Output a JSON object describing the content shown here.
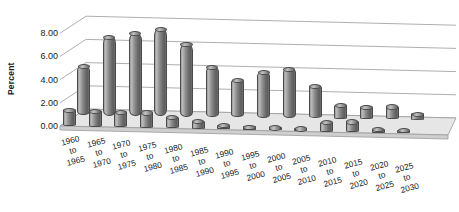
{
  "chart_data": {
    "type": "bar",
    "title": "",
    "subtitle": "",
    "xlabel": "",
    "ylabel": "Percent",
    "ylim": [
      0,
      8
    ],
    "yticks": [
      "0.00",
      "2.00",
      "4.00",
      "6.00",
      "8.00"
    ],
    "ytick_values": [
      0,
      2,
      4,
      6,
      8
    ],
    "grid": true,
    "legend": "none",
    "projection": "3d-cylinder",
    "categories": [
      "1960 to 1965",
      "1965 to 1970",
      "1970 to 1975",
      "1975 to 1980",
      "1980 to 1985",
      "1985 to 1990",
      "1990 to 1995",
      "1995 to 2000",
      "2000 to 2005",
      "2005 to 2010",
      "2010 to 2015",
      "2015 to 2020",
      "2020 to 2025",
      "2025 to 2030"
    ],
    "category_lines": [
      [
        "1960",
        "to",
        "1965"
      ],
      [
        "1965",
        "to",
        "1970"
      ],
      [
        "1970",
        "to",
        "1975"
      ],
      [
        "1975",
        "to",
        "1980"
      ],
      [
        "1980",
        "to",
        "1985"
      ],
      [
        "1985",
        "to",
        "1990"
      ],
      [
        "1990",
        "to",
        "1995"
      ],
      [
        "1995",
        "to",
        "2000"
      ],
      [
        "2000",
        "to",
        "2005"
      ],
      [
        "2005",
        "to",
        "2010"
      ],
      [
        "2010",
        "to",
        "2015"
      ],
      [
        "2015",
        "to",
        "2020"
      ],
      [
        "2020",
        "to",
        "2025"
      ],
      [
        "2025",
        "to",
        "2030"
      ]
    ],
    "series": [
      {
        "name": "back-row",
        "values": [
          4.3,
          6.85,
          7.2,
          7.6,
          6.3,
          4.35,
          3.3,
          3.95,
          4.3,
          2.85,
          1.2,
          1.05,
          1.15,
          0.55
        ]
      },
      {
        "name": "front-row",
        "values": [
          1.45,
          1.4,
          1.35,
          1.35,
          1.0,
          0.7,
          0.4,
          0.3,
          0.3,
          0.25,
          0.85,
          0.95,
          0.35,
          0.3
        ]
      }
    ],
    "colors": {
      "bar_light": "#b9b9b9",
      "bar_mid": "#8d8d8d",
      "bar_dark": "#5e5e5e",
      "bar_outline": "#4a4a4a",
      "gridline": "#9a9a9a",
      "floor": "#d8d8d8",
      "text": "#1a1a1a",
      "background": "#ffffff"
    }
  }
}
